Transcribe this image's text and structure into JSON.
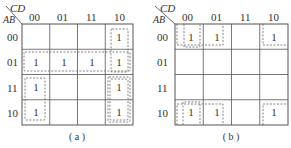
{
  "maps": [
    {
      "id": "a",
      "caption": "( a )",
      "corner": {
        "col_var": "CD",
        "row_var": "AB"
      },
      "col_labels": [
        "00",
        "01",
        "11",
        "10"
      ],
      "row_labels": [
        "00",
        "01",
        "11",
        "10"
      ],
      "cells": [
        [
          "",
          "",
          "",
          "1"
        ],
        [
          "1",
          "1",
          "1",
          "1"
        ],
        [
          "1",
          "",
          "",
          "1"
        ],
        [
          "1",
          "",
          "",
          "1"
        ]
      ],
      "groups": [
        "row 01 (all four cells)",
        "column 10 rows 00-01",
        "column 10 rows 11-10",
        "column 00 rows 11-10"
      ]
    },
    {
      "id": "b",
      "caption": "( b )",
      "corner": {
        "col_var": "CD",
        "row_var": "AB"
      },
      "col_labels": [
        "00",
        "01",
        "11",
        "10"
      ],
      "row_labels": [
        "00",
        "01",
        "11",
        "10"
      ],
      "cells": [
        [
          "1",
          "1",
          "",
          "1"
        ],
        [
          "",
          "",
          "",
          ""
        ],
        [
          "",
          "",
          "",
          ""
        ],
        [
          "1",
          "1",
          "",
          "1"
        ]
      ],
      "groups": [
        "column 00 rows 00 & 10 (wrap)",
        "columns 00-01 rows 00 & 10 (wrap)",
        "corners 00/00, 00/10, 10/00, 10/10"
      ]
    }
  ]
}
